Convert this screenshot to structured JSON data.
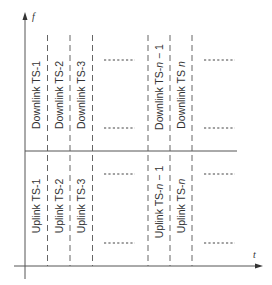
{
  "axes": {
    "y_label": "f",
    "x_label": "t"
  },
  "downlink": {
    "slots": [
      {
        "prefix": "Downlink TS-",
        "index": "1",
        "suffix": ""
      },
      {
        "prefix": "Downlink TS-",
        "index": "2",
        "suffix": ""
      },
      {
        "prefix": "Downlink TS-",
        "index": "3",
        "suffix": ""
      },
      {
        "prefix": "Downlink TS-",
        "index": "n",
        "suffix": " − 1"
      },
      {
        "prefix": "Downlink TS ",
        "index": "n",
        "suffix": ""
      }
    ]
  },
  "uplink": {
    "slots": [
      {
        "prefix": "Uplink TS-",
        "index": "1",
        "suffix": ""
      },
      {
        "prefix": "Uplink TS-",
        "index": "2",
        "suffix": ""
      },
      {
        "prefix": "Uplink TS-",
        "index": "3",
        "suffix": ""
      },
      {
        "prefix": "Uplink TS-",
        "index": "n",
        "suffix": " − 1"
      },
      {
        "prefix": "Uplink TS-",
        "index": "n",
        "suffix": ""
      }
    ]
  },
  "colors": {
    "line": "#555555",
    "text": "#333333"
  }
}
